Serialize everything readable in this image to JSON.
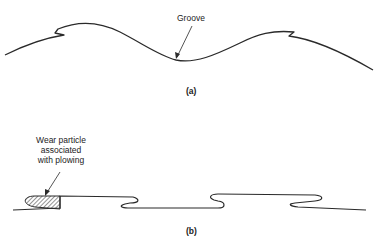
{
  "figure": {
    "panel_a": {
      "caption": "(a)",
      "annotation": "Groove"
    },
    "panel_b": {
      "caption": "(b)",
      "annotation_lines": [
        "Wear particle",
        "associated",
        "with plowing"
      ]
    }
  },
  "colors": {
    "line": "#2a2a2a",
    "background": "#ffffff"
  }
}
